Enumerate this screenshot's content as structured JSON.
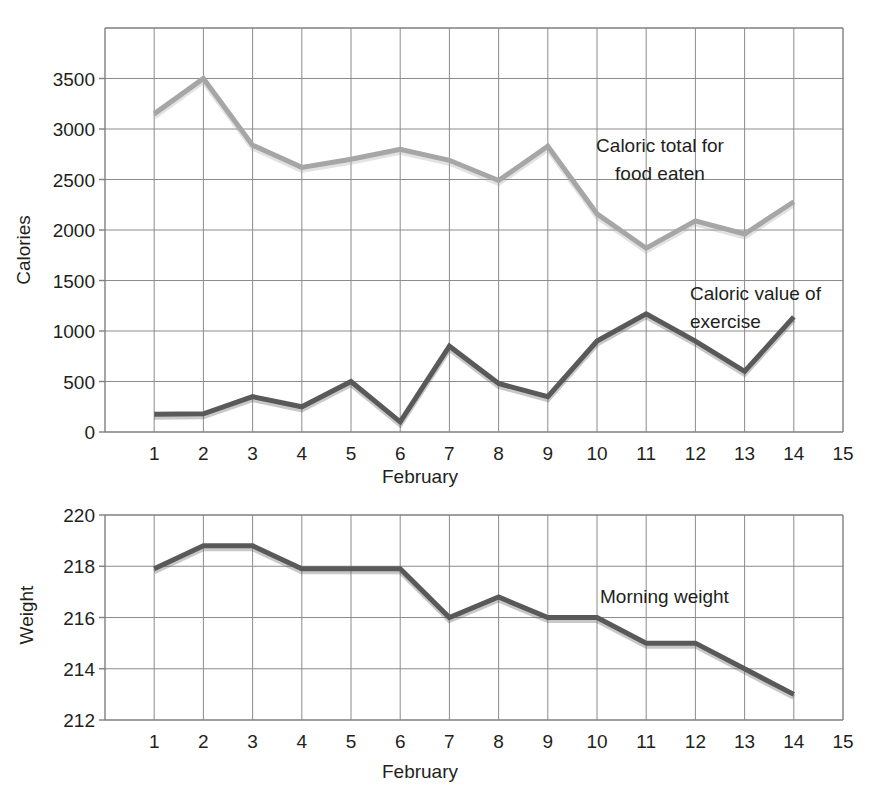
{
  "chart_data": [
    {
      "type": "line",
      "title": "",
      "xlabel": "February",
      "ylabel": "Calories",
      "x": [
        1,
        2,
        3,
        4,
        5,
        6,
        7,
        8,
        9,
        10,
        11,
        12,
        13,
        14
      ],
      "xticks": [
        1,
        2,
        3,
        4,
        5,
        6,
        7,
        8,
        9,
        10,
        11,
        12,
        13,
        14,
        15
      ],
      "yticks": [
        0,
        500,
        1000,
        1500,
        2000,
        2500,
        3000,
        3500
      ],
      "xlim": [
        0,
        15
      ],
      "ylim": [
        0,
        4000
      ],
      "grid": true,
      "legend": "annotations-on-plot",
      "series": [
        {
          "name": "Caloric total for food eaten",
          "color": "#a6a6a6",
          "values": [
            3150,
            3500,
            2840,
            2620,
            2700,
            2800,
            2690,
            2490,
            2830,
            2160,
            1820,
            2090,
            1960,
            2280
          ],
          "annotation": "Caloric total for\nfood eaten",
          "annotation_lines": [
            "Caloric total for",
            "food eaten"
          ]
        },
        {
          "name": "Caloric value of exercise",
          "color": "#595959",
          "values": [
            175,
            180,
            350,
            250,
            500,
            100,
            850,
            480,
            350,
            900,
            1170,
            900,
            600,
            1140
          ],
          "annotation": "Caloric value of\nexercise",
          "annotation_lines": [
            "Caloric value of",
            "exercise"
          ]
        }
      ]
    },
    {
      "type": "line",
      "title": "",
      "xlabel": "February",
      "ylabel": "Weight",
      "x": [
        1,
        2,
        3,
        4,
        5,
        6,
        7,
        8,
        9,
        10,
        11,
        12,
        13,
        14
      ],
      "xticks": [
        1,
        2,
        3,
        4,
        5,
        6,
        7,
        8,
        9,
        10,
        11,
        12,
        13,
        14,
        15
      ],
      "yticks": [
        212,
        214,
        216,
        218,
        220
      ],
      "xlim": [
        0,
        15
      ],
      "ylim": [
        212,
        220
      ],
      "grid": true,
      "legend": "annotations-on-plot",
      "series": [
        {
          "name": "Morning weight",
          "color": "#595959",
          "values": [
            217.9,
            218.8,
            218.8,
            217.9,
            217.9,
            217.9,
            216.0,
            216.8,
            216.0,
            216.0,
            215.0,
            215.0,
            214.0,
            213.0
          ],
          "annotation": "Morning weight",
          "annotation_lines": [
            "Morning weight"
          ]
        }
      ]
    }
  ],
  "colors": {
    "food_line": "#a6a6a6",
    "exercise_line": "#595959",
    "weight_line": "#595959",
    "grid": "#8c8c8c",
    "axis": "#7f7f7f",
    "text": "#231f20"
  },
  "calories_panel": {
    "y_axis_title": "Calories",
    "x_axis_title": "February",
    "y_tick_labels": [
      "0",
      "500",
      "1000",
      "1500",
      "2000",
      "2500",
      "3000",
      "3500"
    ],
    "x_tick_labels": [
      "1",
      "2",
      "3",
      "4",
      "5",
      "6",
      "7",
      "8",
      "9",
      "10",
      "11",
      "12",
      "13",
      "14",
      "15"
    ],
    "annotation_food_line1": "Caloric total for",
    "annotation_food_line2": "food eaten",
    "annotation_exercise_line1": "Caloric value of",
    "annotation_exercise_line2": "exercise"
  },
  "weight_panel": {
    "y_axis_title": "Weight",
    "x_axis_title": "February",
    "y_tick_labels": [
      "212",
      "214",
      "216",
      "218",
      "220"
    ],
    "x_tick_labels": [
      "1",
      "2",
      "3",
      "4",
      "5",
      "6",
      "7",
      "8",
      "9",
      "10",
      "11",
      "12",
      "13",
      "14",
      "15"
    ],
    "annotation_weight": "Morning weight"
  }
}
